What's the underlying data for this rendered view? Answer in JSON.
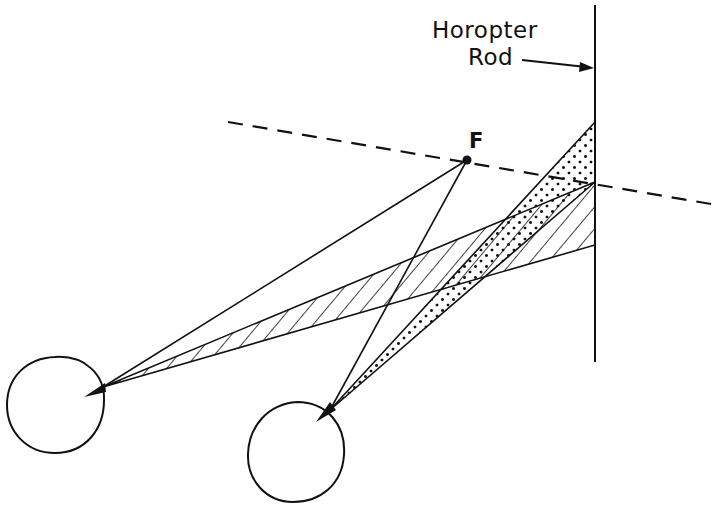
{
  "labels": {
    "horopter_line1": "Horopter",
    "horopter_line2": "Rod",
    "fixation_point": "F"
  },
  "colors": {
    "ink": "#111111",
    "background": "#ffffff"
  },
  "geometry": {
    "rod": {
      "x": 595,
      "y_top": 5,
      "y_bottom": 362
    },
    "fixation_point": {
      "x": 467,
      "y": 160
    },
    "left_eye": {
      "cx": 55,
      "cy": 405,
      "r": 48,
      "apex": [
        103,
        387
      ]
    },
    "right_eye": {
      "cx": 295,
      "cy": 455,
      "r": 48,
      "apex": [
        330,
        410
      ]
    },
    "hatched_region": {
      "from_eye": "left",
      "rod_y_top": 182,
      "rod_y_bottom": 245
    },
    "dotted_region": {
      "from_eye": "right",
      "rod_y_top": 122,
      "rod_y_bottom": 182
    },
    "dashed_line": {
      "x1": 228,
      "y1": 122,
      "x2": 717,
      "y2": 205
    }
  }
}
